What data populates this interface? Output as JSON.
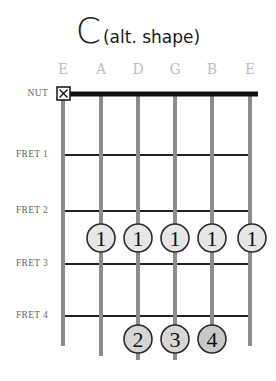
{
  "title": {
    "chord": "C",
    "subtitle": "(alt. shape)"
  },
  "strings": [
    {
      "name": "E",
      "x": 63
    },
    {
      "name": "A",
      "x": 101
    },
    {
      "name": "D",
      "x": 138
    },
    {
      "name": "G",
      "x": 175
    },
    {
      "name": "B",
      "x": 212
    },
    {
      "name": "E",
      "x": 250
    }
  ],
  "nut": {
    "label": "NUT",
    "y": 94,
    "muted_string": "E",
    "muted_symbol": "X"
  },
  "frets": [
    {
      "label": "FRET 1",
      "y": 155
    },
    {
      "label": "FRET 2",
      "y": 211
    },
    {
      "label": "FRET 3",
      "y": 264
    },
    {
      "label": "FRET 4",
      "y": 316
    }
  ],
  "fingers": [
    {
      "string": "A",
      "fret": 3,
      "finger": "1"
    },
    {
      "string": "D",
      "fret": 3,
      "finger": "1"
    },
    {
      "string": "G",
      "fret": 3,
      "finger": "1"
    },
    {
      "string": "B",
      "fret": 3,
      "finger": "1"
    },
    {
      "string": "E",
      "fret": 3,
      "finger": "1"
    },
    {
      "string": "D",
      "fret": 5,
      "finger": "2"
    },
    {
      "string": "G",
      "fret": 5,
      "finger": "3"
    },
    {
      "string": "B",
      "fret": 5,
      "finger": "4"
    }
  ],
  "colors": {
    "string": "#8c8c8c",
    "fret": "#222222",
    "nut": "#111111",
    "finger_fill_barre": "#e6e6e6",
    "finger_fill": "#d2d2d2",
    "finger_stroke": "#2a2a2a"
  }
}
